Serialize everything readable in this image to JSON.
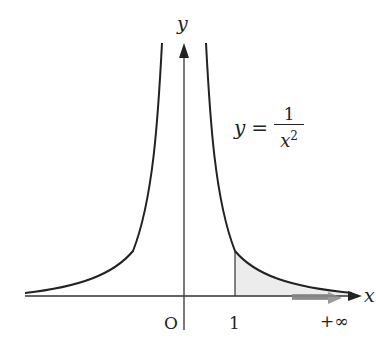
{
  "diagram": {
    "axes": {
      "x_label": "x",
      "y_label": "y",
      "origin_label": "O"
    },
    "ticks": {
      "one": "1",
      "infinity": "+∞"
    },
    "formula": {
      "lhs": "y",
      "eq": "=",
      "numerator": "1",
      "denominator_base": "x",
      "denominator_exp": "2"
    },
    "colors": {
      "curve": "#222222",
      "axis": "#222222",
      "shade": "#e9e9e9",
      "arrow": "#8a8a8a"
    }
  }
}
